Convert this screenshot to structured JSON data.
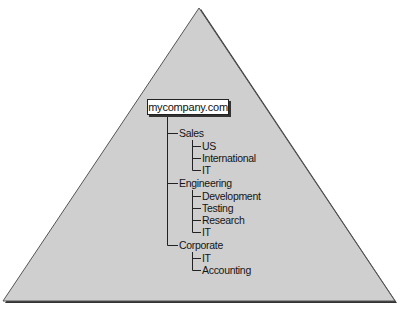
{
  "diagram": {
    "shape": "triangle",
    "fill": "#cfcfcf",
    "stroke": "#2a2a2a",
    "root": {
      "label": "mycompany.com"
    },
    "branches": [
      {
        "label": "Sales",
        "children": [
          "US",
          "International",
          "IT"
        ]
      },
      {
        "label": "Engineering",
        "children": [
          "Development",
          "Testing",
          "Research",
          "IT"
        ]
      },
      {
        "label": "Corporate",
        "children": [
          "IT",
          "Accounting"
        ]
      }
    ]
  }
}
